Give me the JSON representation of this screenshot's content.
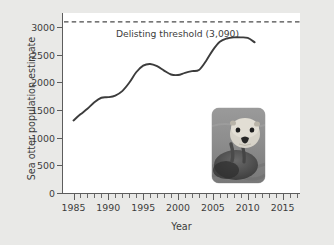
{
  "chart_data": {
    "type": "line",
    "title": "",
    "xlabel": "Year",
    "ylabel": "Sea otter population estimate",
    "xlim": [
      1983.5,
      2017.5
    ],
    "ylim": [
      0,
      3250
    ],
    "grid": false,
    "legend": null,
    "x_ticks": [
      1985,
      1990,
      1995,
      2000,
      2005,
      2010,
      2015
    ],
    "x_tick_labels": [
      "1985",
      "1990",
      "1995",
      "2000",
      "2005",
      "2010",
      "2015"
    ],
    "x_minor_tick_step": 1,
    "y_ticks": [
      0,
      500,
      1000,
      1500,
      2000,
      2500,
      3000
    ],
    "y_tick_labels": [
      "0",
      "500",
      "1000",
      "1500",
      "2000",
      "2500",
      "3000"
    ],
    "series": [
      {
        "name": "Sea otter population estimate",
        "color": "#3c3c3c",
        "x": [
          1985,
          1986,
          1987,
          1988,
          1989,
          1990,
          1991,
          1992,
          1993,
          1994,
          1995,
          1996,
          1997,
          1998,
          1999,
          2000,
          2001,
          2002,
          2003,
          2004,
          2005,
          2006,
          2007,
          2008,
          2009,
          2010,
          2011
        ],
        "values": [
          1310,
          1420,
          1520,
          1640,
          1720,
          1730,
          1760,
          1840,
          1990,
          2180,
          2300,
          2330,
          2290,
          2210,
          2140,
          2130,
          2170,
          2200,
          2220,
          2380,
          2580,
          2730,
          2790,
          2810,
          2810,
          2800,
          2720
        ]
      }
    ],
    "annotations": [
      {
        "name": "delisting-threshold",
        "label": "Delisting threshold (3,090)",
        "value": 3090,
        "style": "dashed-horizontal-line",
        "color": "#3c3c3c"
      }
    ],
    "inset_image": {
      "name": "sea-otter-photo",
      "description": "Grayscale photograph of a sea otter floating on its back in water",
      "x_range": [
        2002.5,
        2011.0
      ],
      "y_range": [
        200,
        1430
      ]
    }
  },
  "colors": {
    "page_background": "#e9e9e7",
    "plot_background": "#ffffff",
    "axis": "#5d5d5d",
    "line": "#3c3c3c",
    "text": "#3c3c3c"
  }
}
